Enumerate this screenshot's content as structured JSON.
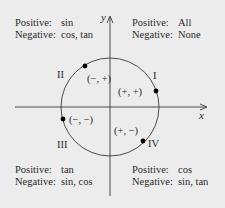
{
  "diagram": {
    "axes": {
      "x_label": "x",
      "y_label": "y"
    },
    "colors": {
      "background": "#ececec",
      "line": "#3a3a3a",
      "text": "#2a2a2a",
      "point": "#000000"
    },
    "quadrants": [
      {
        "numeral": "I",
        "sign_pair": "(+, +)",
        "positive_label": "Positive:",
        "positive": "All",
        "negative_label": "Negative:",
        "negative": "None"
      },
      {
        "numeral": "II",
        "sign_pair": "(−, +)",
        "positive_label": "Positive:",
        "positive": "sin",
        "negative_label": "Negative:",
        "negative": "cos, tan"
      },
      {
        "numeral": "III",
        "sign_pair": "(−, −)",
        "positive_label": "Positive:",
        "positive": "tan",
        "negative_label": "Negative:",
        "negative": "sin, cos"
      },
      {
        "numeral": "IV",
        "sign_pair": "(+, −)",
        "positive_label": "Positive:",
        "positive": "cos",
        "negative_label": "Negative:",
        "negative": "sin, tan"
      }
    ]
  }
}
